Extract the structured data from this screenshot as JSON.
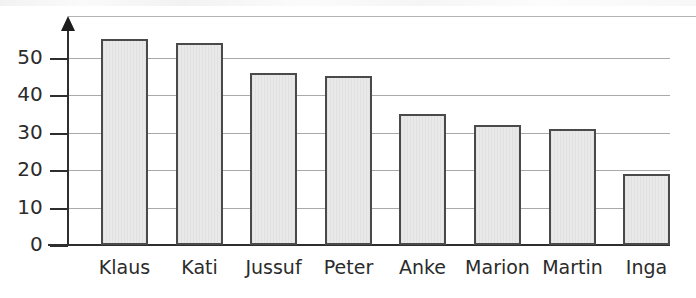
{
  "chart_data": {
    "type": "bar",
    "title": "",
    "subtitle": "",
    "xlabel": "",
    "ylabel": "",
    "categories": [
      "Klaus",
      "Kati",
      "Jussuf",
      "Peter",
      "Anke",
      "Marion",
      "Martin",
      "Inga"
    ],
    "values": [
      55,
      54,
      46,
      45,
      35,
      32,
      31,
      19
    ],
    "ylim": [
      0,
      62
    ],
    "yticks": [
      0,
      10,
      20,
      30,
      40,
      50
    ],
    "ytick_labels": [
      "0",
      "10",
      "20",
      "30",
      "40",
      "50"
    ],
    "grid": true,
    "grid_axis": "y",
    "legend": false,
    "legend_position": "none",
    "annotations": [],
    "colors": {
      "bar_fill": "#e9e9e9",
      "bar_border": "#4a4a4a",
      "gridline": "#a9a9a9",
      "axis": "#2e2e2e",
      "text": "#2b2b2b",
      "background": "#ffffff"
    }
  }
}
